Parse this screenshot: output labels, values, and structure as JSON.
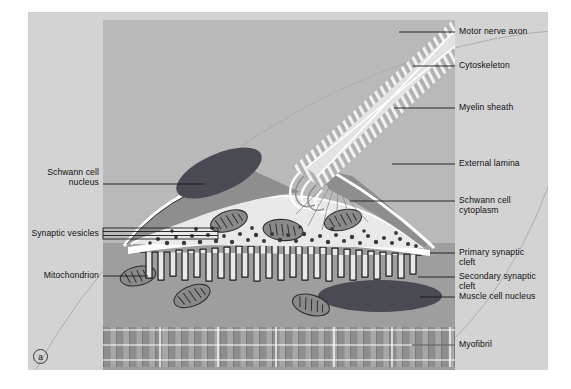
{
  "figure": {
    "panel_letter": "a",
    "title_visible": false,
    "type": "biological-diagram",
    "colors": {
      "outer_background": "#ffffff",
      "panel_background": "#d3d3d3",
      "illustration_background": "#b9b9b9",
      "nucleus_dark": "#4a4a52",
      "schwann_cytoplasm": "#8e8e8e",
      "axon_terminal": "#e9e9e9",
      "external_lamina": "#ffffff",
      "mitochondrion": "#8a8a8a",
      "vesicle": "#3a3a3a",
      "myofibril_band": "#9a9a9a",
      "leader_line": "#1a1a1a",
      "arc_line": "#9b9b9b"
    }
  },
  "labels_right": [
    {
      "id": "motor-nerve-axon",
      "text": "Motor nerve axon"
    },
    {
      "id": "cytoskeleton",
      "text": "Cytoskeleton"
    },
    {
      "id": "myelin-sheath",
      "text": "Myelin sheath"
    },
    {
      "id": "external-lamina",
      "text": "External lamina"
    },
    {
      "id": "schwann-cell-cytoplasm",
      "text": "Schwann cell\ncytoplasm"
    },
    {
      "id": "primary-synaptic-cleft",
      "text": "Primary synaptic\ncleft"
    },
    {
      "id": "secondary-synaptic-cleft",
      "text": "Secondary synaptic\ncleft"
    },
    {
      "id": "muscle-cell-nucleus",
      "text": "Muscle cell nucleus"
    },
    {
      "id": "myofibril",
      "text": "Myofibril"
    }
  ],
  "labels_left": [
    {
      "id": "schwann-cell-nucleus",
      "text": "Schwann cell\nnucleus"
    },
    {
      "id": "synaptic-vesicles",
      "text": "Synaptic vesicles"
    },
    {
      "id": "mitochondrion",
      "text": "Mitochondrion"
    }
  ],
  "label_text": {
    "motor_nerve_axon": "Motor nerve axon",
    "cytoskeleton": "Cytoskeleton",
    "myelin_sheath": "Myelin sheath",
    "external_lamina": "External lamina",
    "schwann_cell_cytoplasm_l1": "Schwann cell",
    "schwann_cell_cytoplasm_l2": "cytoplasm",
    "primary_synaptic_cleft_l1": "Primary synaptic",
    "primary_synaptic_cleft_l2": "cleft",
    "secondary_synaptic_cleft_l1": "Secondary synaptic",
    "secondary_synaptic_cleft_l2": "cleft",
    "muscle_cell_nucleus": "Muscle cell nucleus",
    "myofibril": "Myofibril",
    "schwann_cell_nucleus_l1": "Schwann cell",
    "schwann_cell_nucleus_l2": "nucleus",
    "synaptic_vesicles": "Synaptic vesicles",
    "mitochondrion": "Mitochondrion",
    "panel_letter": "a"
  }
}
